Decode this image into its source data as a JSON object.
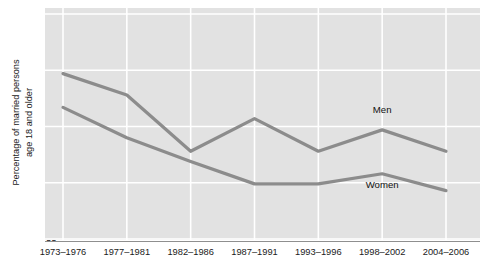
{
  "chart_data": {
    "type": "line",
    "title": "",
    "xlabel": "",
    "ylabel": "Percentage of married persons age 18 and older",
    "ylabel_line1": "Percentage of married persons",
    "ylabel_line2": "age 18 and older",
    "categories": [
      "1973–1976",
      "1977–1981",
      "1982–1986",
      "1987–1991",
      "1993–1996",
      "1998–2002",
      "2004–2006"
    ],
    "ylim": [
      55,
      75
    ],
    "yticks": [
      55,
      60,
      65,
      70,
      75
    ],
    "ytick_labels": [
      "55",
      "60",
      "65",
      "70",
      "75"
    ],
    "grid": true,
    "grid_color": "#ffffff",
    "plot_background": "#e2e2e2",
    "legend_position": "inline",
    "series": [
      {
        "name": "Men",
        "color": "#8c8c8c",
        "values": [
          69.7,
          67.8,
          62.8,
          65.7,
          62.8,
          64.7,
          62.8
        ],
        "label_text": "Men",
        "label_x_category": "1998–2002",
        "label_y_value": 66.6
      },
      {
        "name": "Women",
        "color": "#8c8c8c",
        "values": [
          66.7,
          64.0,
          61.9,
          59.9,
          59.9,
          60.8,
          59.3
        ],
        "label_text": "Women",
        "label_x_category": "1998–2002",
        "label_y_value": 59.9
      }
    ]
  },
  "axis": {
    "y_tick_0": "55",
    "y_tick_1": "60",
    "y_tick_2": "65",
    "y_tick_3": "70",
    "y_tick_4": "75",
    "x_tick_0": "1973–1976",
    "x_tick_1": "1977–1981",
    "x_tick_2": "1982–1986",
    "x_tick_3": "1987–1991",
    "x_tick_4": "1993–1996",
    "x_tick_5": "1998–2002",
    "x_tick_6": "2004–2006"
  },
  "labels": {
    "men": "Men",
    "women": "Women"
  }
}
